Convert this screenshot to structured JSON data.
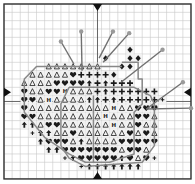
{
  "chart": {
    "title": "",
    "grid": {
      "cols": 23,
      "rows": 21,
      "left": 4,
      "top": 4,
      "cell_w": 8.13,
      "cell_h": 8.33,
      "major_every": 10
    },
    "center_col": 11.5,
    "center_row": 11.7,
    "colors": {
      "grid_minor": "#c8c8c8",
      "grid_major": "#555555",
      "border": "#333333",
      "symbol": "#1a1a1a",
      "fill_light": "#f2f2f2",
      "outline": "#888888",
      "pin_line": "#707070",
      "pin_head": "#9a9a9a",
      "marker": "#111111"
    },
    "legend": [
      {
        "key": "T",
        "icon": "triangle-outline-icon",
        "meaning": "light apple color"
      },
      {
        "key": "H",
        "icon": "letter-h-icon",
        "meaning": "highlight color"
      },
      {
        "key": "V",
        "icon": "heart-icon",
        "meaning": "dark apple color"
      },
      {
        "key": "A",
        "icon": "arrow-up-icon",
        "meaning": "shadow color"
      },
      {
        "key": "P",
        "icon": "plus-icon",
        "meaning": "mid apple color"
      },
      {
        "key": "D",
        "icon": "diamond-icon",
        "meaning": "stem/leaf color"
      },
      {
        "key": "S",
        "icon": "small-plus-icon",
        "meaning": "quarter stitch"
      }
    ],
    "cells": [
      "......................",
      "......................",
      "......................",
      "......................",
      "......................",
      "...............D.......",
      "............D..DD......",
      ".....TTTTTTT..DD.......",
      "...TTTTTVPPPPD.........",
      "..TTTTVVVVAPAPPP.......",
      "..VTTVVHTTTPAPPPPPP....",
      "..VVTHTTTTAAPAPPPPPS...",
      "..VTTTTTTTTTTHTTVVV....",
      "..VVTTTTTTTTHTTTVVT....",
      "..AATVVTTTTTTHTTVTT....",
      "...SAATTVTTTTTTVTVT....",
      "....AVVVTATTTTVVVVV....",
      ".....AAVVVVVVVTVVT.....",
      ".......SAVVVVVAVTVS....",
      ".........SAAAAAAA......",
      "......................"
    ],
    "outlines": [
      [
        [
          14.5,
          7
        ],
        [
          16.5,
          7
        ],
        [
          16.5,
          9
        ],
        [
          17,
          9
        ],
        [
          17,
          12
        ],
        [
          16,
          13
        ],
        [
          16,
          18
        ],
        [
          13,
          19
        ],
        [
          10,
          19
        ],
        [
          8,
          18
        ],
        [
          5,
          16
        ],
        [
          2.5,
          13
        ],
        [
          2.5,
          9
        ],
        [
          4,
          7.5
        ],
        [
          14.5,
          7.5
        ]
      ],
      [
        [
          8,
          10
        ],
        [
          16,
          10
        ],
        [
          18,
          11
        ],
        [
          18.5,
          12
        ],
        [
          18.5,
          17
        ],
        [
          17,
          19
        ],
        [
          10,
          19.5
        ],
        [
          8,
          18.5
        ],
        [
          7,
          17
        ],
        [
          7,
          12
        ],
        [
          8,
          10
        ]
      ],
      [
        [
          11,
          11
        ],
        [
          11,
          19
        ]
      ]
    ],
    "pins": [
      {
        "x1": 8.6,
        "y1": 7.2,
        "x2": 7,
        "y2": 4.5
      },
      {
        "x1": 9.6,
        "y1": 8,
        "x2": 9.5,
        "y2": 3.3
      },
      {
        "x1": 11.7,
        "y1": 6.5,
        "x2": 13.4,
        "y2": 3.3
      },
      {
        "x1": 12.2,
        "y1": 7,
        "x2": 15.4,
        "y2": 3.5
      },
      {
        "x1": 14.4,
        "y1": 9.4,
        "x2": 19.5,
        "y2": 5.5
      },
      {
        "x1": 17.5,
        "y1": 12.6,
        "x2": 22,
        "y2": 9.4
      },
      {
        "x1": 17.5,
        "y1": 12.6,
        "x2": 23,
        "y2": 12.5
      }
    ],
    "markers": [
      {
        "id": "top-center-marker",
        "side": "top",
        "pos": 11.5
      },
      {
        "id": "bottom-center-marker",
        "side": "bottom",
        "pos": 11.5
      },
      {
        "id": "left-center-marker",
        "side": "left",
        "pos": 10.6
      },
      {
        "id": "right-center-marker",
        "side": "right",
        "pos": 10.6
      }
    ]
  }
}
